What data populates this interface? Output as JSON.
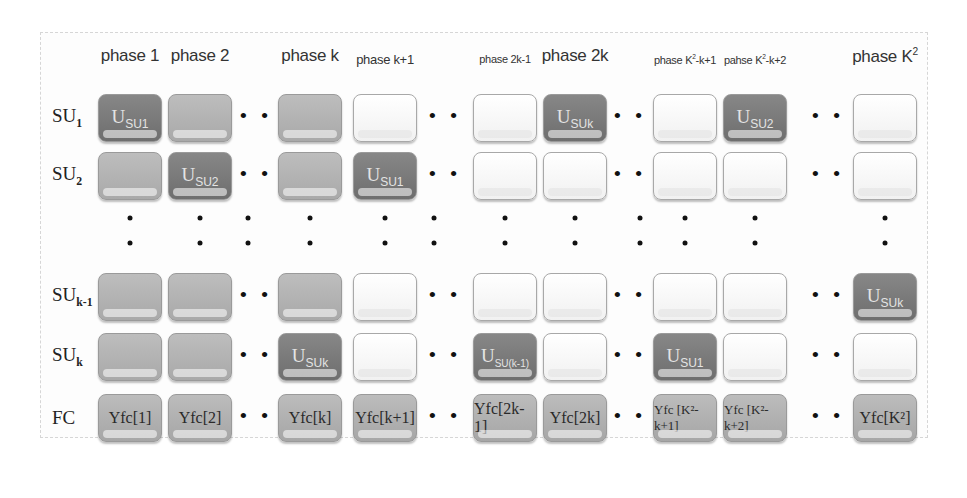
{
  "diagram": {
    "phases": [
      {
        "label": "phase 1",
        "sup": "",
        "size": "big",
        "x": 130
      },
      {
        "label": "phase 2",
        "sup": "",
        "size": "big",
        "x": 200
      },
      {
        "label": "phase k",
        "sup": "",
        "size": "big",
        "x": 310
      },
      {
        "label": "phase k+1",
        "sup": "",
        "size": "sm",
        "x": 385
      },
      {
        "label": "phase 2k-1",
        "sup": "",
        "size": "xs",
        "x": 505
      },
      {
        "label": "phase 2k",
        "sup": "",
        "size": "big",
        "x": 575
      },
      {
        "label": "phase K",
        "sup": "2",
        "suffix": "-k+1",
        "size": "xs",
        "x": 685
      },
      {
        "label": "pahse K",
        "sup": "2",
        "suffix": "-k+2",
        "size": "xs",
        "x": 755
      },
      {
        "label": "phase K",
        "sup": "2",
        "suffix": "",
        "size": "big",
        "x": 885
      }
    ],
    "rows": [
      {
        "label": "SU",
        "sub": "1",
        "y": 118
      },
      {
        "label": "SU",
        "sub": "2",
        "y": 176
      },
      {
        "label": "SU",
        "sub": "k-1",
        "y": 297
      },
      {
        "label": "SU",
        "sub": "k",
        "y": 357
      },
      {
        "label": "FC",
        "sub": "",
        "y": 418
      }
    ],
    "cells": {
      "SU1": [
        "dark:U:SU1",
        "gray",
        "gray",
        "white",
        "white",
        "dark:U:SUk",
        "white",
        "dark:U:SU2",
        "white"
      ],
      "SU2": [
        "gray",
        "dark:U:SU2",
        "gray",
        "dark:U:SU1",
        "white",
        "white",
        "white",
        "white",
        "white"
      ],
      "SUk-1": [
        "gray",
        "gray",
        "gray",
        "white",
        "white",
        "white",
        "white",
        "white",
        "dark:U:SUk"
      ],
      "SUk": [
        "gray",
        "gray",
        "dark:U:SUk",
        "white",
        "dark:U:SU(k-1)",
        "white",
        "dark:U:SU1",
        "white",
        "white"
      ],
      "FC": [
        "Yfc[1]",
        "Yfc[2]",
        "Yfc[k]",
        "Yfc[k+1]",
        "Yfc[2k-1]",
        "Yfc[2k]",
        "Yfc [K²-k+1]",
        "Yfc [K²-k+2]",
        "Yfc[K²]"
      ]
    },
    "ellipsis": "• •"
  }
}
